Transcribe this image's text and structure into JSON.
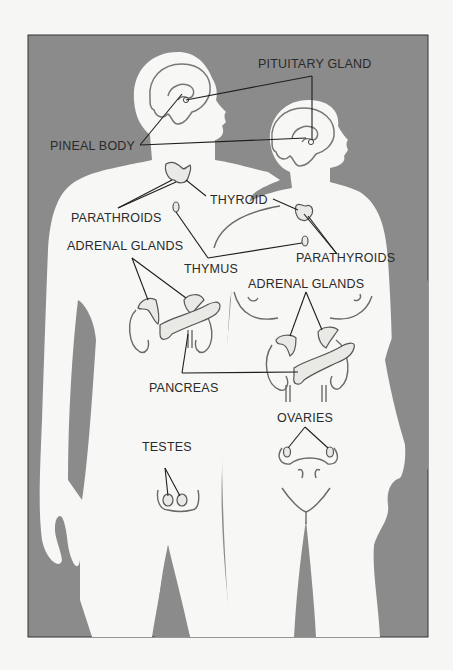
{
  "figure": {
    "background_color": "#8b8b8b",
    "body_color": "#f7f7f5",
    "paper_color": "#f6f6f4",
    "frame": {
      "x": 28,
      "y": 35,
      "width": 400,
      "height": 602
    }
  },
  "labels": {
    "pituitary_gland": "PITUITARY GLAND",
    "pineal_body": "PINEAL BODY",
    "thyroid": "THYROID",
    "parathroids_male": "PARATHROIDS",
    "parathyroids_female": "PARATHYROIDS",
    "adrenal_glands_male": "ADRENAL GLANDS",
    "adrenal_glands_female": "ADRENAL GLANDS",
    "thymus": "THYMUS",
    "pancreas": "PANCREAS",
    "ovaries": "OVARIES",
    "testes": "TESTES"
  },
  "figures": [
    {
      "name": "male-figure",
      "side": "left"
    },
    {
      "name": "female-figure",
      "side": "right"
    }
  ]
}
